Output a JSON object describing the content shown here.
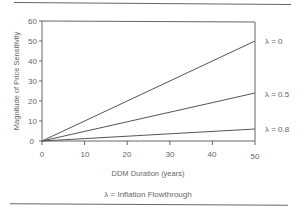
{
  "chart_data": {
    "type": "line",
    "title": "",
    "xlabel": "DDM Duration (years)",
    "ylabel": "Magnitude of Price Sensitivity",
    "xlim": [
      0,
      50
    ],
    "ylim": [
      0,
      60
    ],
    "xticks": [
      0,
      10,
      20,
      30,
      40,
      50
    ],
    "yticks": [
      0,
      10,
      20,
      30,
      40,
      50,
      60
    ],
    "grid": false,
    "legend_position": "inline-right",
    "x": [
      0,
      50
    ],
    "series": [
      {
        "name": "λ = 0",
        "values": [
          0,
          50
        ]
      },
      {
        "name": "λ = 0.5",
        "values": [
          0,
          24
        ]
      },
      {
        "name": "λ = 0.8",
        "values": [
          0,
          6
        ]
      }
    ],
    "annotations": [
      "λ = Inflation Flowthrough"
    ]
  },
  "labels": {
    "xlabel": "DDM Duration (years)",
    "ylabel": "Magnitude of Price Sensitivity",
    "caption": "λ = Inflation Flowthrough",
    "series": [
      "λ = 0",
      "λ = 0.5",
      "λ = 0.8"
    ],
    "xticks": [
      "0",
      "10",
      "20",
      "30",
      "40",
      "50"
    ],
    "yticks": [
      "0",
      "10",
      "20",
      "30",
      "40",
      "50",
      "60"
    ]
  },
  "colors": {
    "line": "#555555",
    "axis": "#666666",
    "text": "#666666"
  }
}
